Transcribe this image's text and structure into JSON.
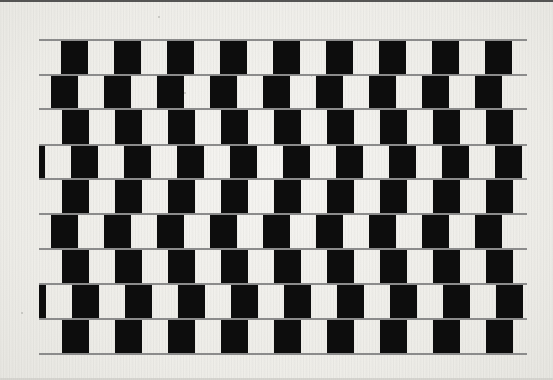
{
  "figure": {
    "width": 553,
    "height": 380,
    "background_color": "#f2f1ed",
    "tile_color": "#0d0d0d",
    "mortar_color": "#8c8c8c",
    "top_band_color": "#3b3b3b"
  },
  "pattern": {
    "name": "cafe-wall",
    "row_count": 9,
    "tiles_per_row": 9,
    "tile_width": 27,
    "tile_period": 53,
    "row_height": 35,
    "pattern_left": 39,
    "pattern_right": 527,
    "pattern_top": 39,
    "pattern_bottom": 353,
    "mortar_thickness": 2,
    "mortar_y_positions": [
      39,
      74,
      108,
      144,
      178,
      213,
      248,
      283,
      318,
      353
    ],
    "rows": [
      {
        "index": 1,
        "y": 41,
        "offset": 22,
        "height": 33
      },
      {
        "index": 2,
        "y": 76,
        "offset": 12,
        "height": 32
      },
      {
        "index": 3,
        "y": 110,
        "offset": 23,
        "height": 34
      },
      {
        "index": 4,
        "y": 146,
        "offset": 32,
        "height": 32
      },
      {
        "index": 5,
        "y": 180,
        "offset": 23,
        "height": 33
      },
      {
        "index": 6,
        "y": 215,
        "offset": 12,
        "height": 33
      },
      {
        "index": 7,
        "y": 250,
        "offset": 23,
        "height": 33
      },
      {
        "index": 8,
        "y": 285,
        "offset": 33,
        "height": 33
      },
      {
        "index": 9,
        "y": 320,
        "offset": 23,
        "height": 33
      }
    ]
  },
  "specks": [
    {
      "x": 158,
      "y": 16,
      "size": 2
    },
    {
      "x": 184,
      "y": 92,
      "size": 2
    },
    {
      "x": 21,
      "y": 312,
      "size": 2
    },
    {
      "x": 311,
      "y": 76,
      "size": 1
    }
  ]
}
